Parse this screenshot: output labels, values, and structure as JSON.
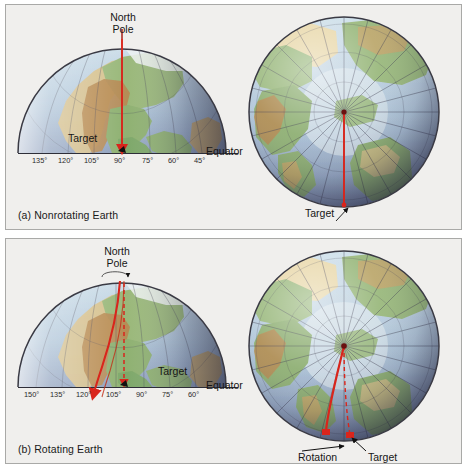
{
  "figure": {
    "background_color": "#f0efed",
    "border_color": "#a9a9a7"
  },
  "panels": [
    {
      "id": "panel-a",
      "caption": "(a) Nonrotating Earth",
      "views": [
        {
          "id": "side-view-a",
          "type": "hemisphere-side-view",
          "labels": {
            "north_pole": "North\nPole",
            "north_pole_line1": "North",
            "north_pole_line2": "Pole",
            "equator": "Equator",
            "target": "Target"
          },
          "longitude_ticks": [
            "135°",
            "120°",
            "105°",
            "90°",
            "75°",
            "60°",
            "45°"
          ],
          "path": {
            "description": "straight red arrow from North Pole due south to Target",
            "shape": "straight",
            "color": "#d9251c"
          }
        },
        {
          "id": "polar-view-a",
          "type": "globe-polar-view",
          "labels": {
            "target": "Target"
          },
          "meridian_count": 24,
          "path": {
            "description": "straight red line from pole center radially outward to Target on the rim",
            "shape": "straight",
            "color": "#d9251c"
          }
        }
      ]
    },
    {
      "id": "panel-b",
      "caption": "(b) Rotating Earth",
      "views": [
        {
          "id": "side-view-b",
          "type": "hemisphere-side-view",
          "labels": {
            "north_pole": "North\nPole",
            "north_pole_line1": "North",
            "north_pole_line2": "Pole",
            "equator": "Equator",
            "target": "Target"
          },
          "longitude_ticks": [
            "150°",
            "135°",
            "120°",
            "105°",
            "90°",
            "75°",
            "60°"
          ],
          "path": {
            "description": "red path curving to the right (west) away from the dashed straight line to Target",
            "shape": "curved-right",
            "color": "#d9251c"
          },
          "reference_path": {
            "description": "dashed red line from North Pole straight down to Target",
            "shape": "dashed-straight",
            "color": "#d9251c"
          },
          "rotation_indicator": "counterclockwise arrow at North Pole"
        },
        {
          "id": "polar-view-b",
          "type": "globe-polar-view",
          "labels": {
            "rotation": "Rotation",
            "target": "Target"
          },
          "meridian_count": 24,
          "path": {
            "description": "red curved path from pole center deflecting right, landing left of Target",
            "shape": "curved-right",
            "color": "#d9251c"
          },
          "reference_path": {
            "description": "dashed red line from pole center to Target",
            "shape": "dashed-straight",
            "color": "#d9251c"
          }
        }
      ]
    }
  ],
  "colors": {
    "path_red": "#d9251c",
    "ocean_light": "#b9cede",
    "ocean_deep": "#6f7d9c",
    "land_green": "#8fb173",
    "land_tan": "#d8c089",
    "mountain_brown": "#b78a52",
    "ice_white": "#eef2f2",
    "grid_line": "#4a4a58",
    "text": "#161616"
  }
}
